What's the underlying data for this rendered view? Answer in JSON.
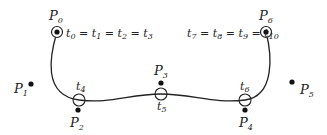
{
  "diagram": {
    "curve_color": "#222222",
    "control_points": [
      {
        "name": "P",
        "sub": "0",
        "x": 57,
        "y": 32
      },
      {
        "name": "P",
        "sub": "1",
        "x": 31,
        "y": 84
      },
      {
        "name": "P",
        "sub": "2",
        "x": 78,
        "y": 109
      },
      {
        "name": "P",
        "sub": "3",
        "x": 161,
        "y": 83
      },
      {
        "name": "P",
        "sub": "4",
        "x": 245,
        "y": 109
      },
      {
        "name": "P",
        "sub": "5",
        "x": 292,
        "y": 82
      },
      {
        "name": "P",
        "sub": "6",
        "x": 266,
        "y": 32
      }
    ],
    "knot_labels": {
      "start": {
        "parts": [
          "t",
          "0",
          " = ",
          "t",
          "1",
          " = ",
          "t",
          "2",
          " = ",
          "t",
          "3"
        ]
      },
      "end": {
        "parts": [
          "t",
          "7",
          " = ",
          "t",
          "8",
          " = ",
          "t",
          "9",
          " = ",
          "t",
          "10"
        ]
      },
      "t4": {
        "name": "t",
        "sub": "4"
      },
      "t5": {
        "name": "t",
        "sub": "5"
      },
      "t6": {
        "name": "t",
        "sub": "6"
      }
    },
    "labels": {
      "p0": "P",
      "p0_sub": "0",
      "p1": "P",
      "p1_sub": "1",
      "p2": "P",
      "p2_sub": "2",
      "p3": "P",
      "p3_sub": "3",
      "p4": "P",
      "p4_sub": "4",
      "p5": "P",
      "p5_sub": "5",
      "p6": "P",
      "p6_sub": "6",
      "t": "t",
      "eq": " = ",
      "s0": "0",
      "s1": "1",
      "s2": "2",
      "s3": "3",
      "s4": "4",
      "s5": "5",
      "s6": "6",
      "s7": "7",
      "s8": "8",
      "s9": "9",
      "s10": "10"
    }
  }
}
